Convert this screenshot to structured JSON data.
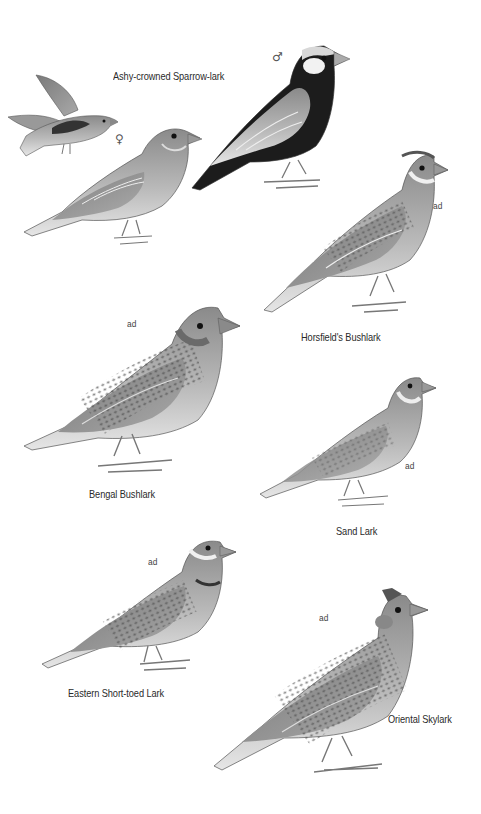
{
  "plate": {
    "background": "#ffffff",
    "ink_color": "#2a2a2a",
    "species": [
      {
        "name": "Ashy-crowned Sparrow-lark",
        "figures": [
          {
            "tag": "",
            "pose": "flight"
          },
          {
            "tag": "♀",
            "pose": "standing"
          },
          {
            "tag": "♂",
            "pose": "standing"
          }
        ]
      },
      {
        "name": "Horsfield's Bushlark",
        "figures": [
          {
            "tag": "ad",
            "pose": "standing"
          }
        ]
      },
      {
        "name": "Bengal Bushlark",
        "figures": [
          {
            "tag": "ad",
            "pose": "standing"
          }
        ]
      },
      {
        "name": "Sand Lark",
        "figures": [
          {
            "tag": "ad",
            "pose": "standing"
          }
        ]
      },
      {
        "name": "Eastern Short-toed Lark",
        "figures": [
          {
            "tag": "ad",
            "pose": "standing"
          }
        ]
      },
      {
        "name": "Oriental Skylark",
        "figures": [
          {
            "tag": "ad",
            "pose": "standing"
          }
        ]
      }
    ]
  }
}
